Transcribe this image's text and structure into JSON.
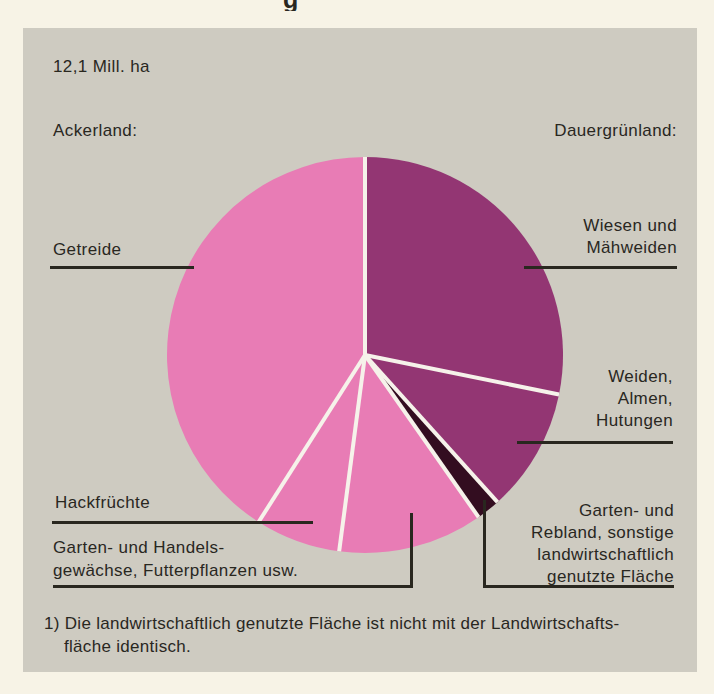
{
  "page": {
    "partial_title_glyph": "g"
  },
  "header": {
    "total_area": "12,1 Mill. ha",
    "left_group": "Ackerland:",
    "right_group": "Dauergrünland:"
  },
  "labels": {
    "getreide": "Getreide",
    "wiesen": "Wiesen und\nMähweiden",
    "weiden": "Weiden,\nAlmen,\nHutungen",
    "hackfruechte": "Hackfrüchte",
    "garten_handels": "Garten- und Handels-\ngewächse, Futterpflanzen usw.",
    "rebland": "Garten- und\nRebland, sonstige\nlandwirtschaftlich\ngenutzte Fläche"
  },
  "footnote": {
    "line1": "1) Die landwirtschaftlich genutzte Fläche ist nicht mit der Landwirtschafts-",
    "line2": "fläche identisch."
  },
  "colors": {
    "page_background": "#f7f3e6",
    "panel_background": "#cecbc1",
    "pink_ackerland": "#e87cb5",
    "purple_dauergruenland": "#933673",
    "dark_sliver": "#330d20",
    "divider_white": "#f6f2ea",
    "text_and_lines": "#29271f"
  },
  "chart_data": {
    "type": "pie",
    "title": "12,1 Mill. ha",
    "groups": [
      "Ackerland",
      "Dauergrünland"
    ],
    "note": "shares estimated from slice angles; no numeric values printed in figure",
    "slices": [
      {
        "label": "Wiesen und Mähweiden",
        "group": "Dauergrünland",
        "start_deg": 0,
        "end_deg": 101.5,
        "share_pct": 28.2,
        "color": "#933673"
      },
      {
        "label": "Weiden, Almen, Hutungen",
        "group": "Dauergrünland",
        "start_deg": 101.5,
        "end_deg": 138,
        "share_pct": 10.1,
        "color": "#933673"
      },
      {
        "label": "Garten- und Rebland, sonstige landwirtschaftlich genutzte Fläche",
        "group": "Sonstige",
        "start_deg": 138,
        "end_deg": 145,
        "share_pct": 1.9,
        "color": "#330d20"
      },
      {
        "label": "Garten- und Handelsgewächse, Futterpflanzen usw.",
        "group": "Ackerland",
        "start_deg": 145,
        "end_deg": 187.5,
        "share_pct": 11.8,
        "color": "#e87cb5"
      },
      {
        "label": "Hackfrüchte",
        "group": "Ackerland",
        "start_deg": 187.5,
        "end_deg": 212.5,
        "share_pct": 6.9,
        "color": "#e87cb5"
      },
      {
        "label": "Getreide",
        "group": "Ackerland",
        "start_deg": 212.5,
        "end_deg": 360,
        "share_pct": 41.1,
        "color": "#e87cb5"
      }
    ],
    "divider_color": "#f6f2ea",
    "legend_position": "none",
    "grid": false
  }
}
